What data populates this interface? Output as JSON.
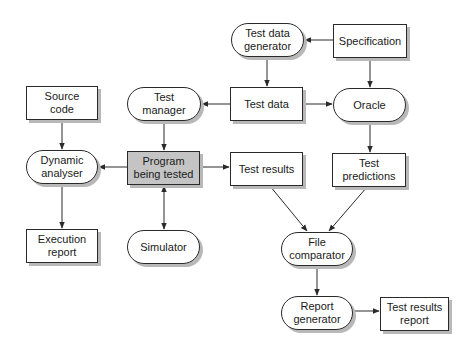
{
  "diagram": {
    "nodes": [
      {
        "id": "test-data-generator",
        "label": "Test data\ngenerator",
        "shape": "pill",
        "x": 231,
        "y": 23,
        "w": 73,
        "h": 34
      },
      {
        "id": "specification",
        "label": "Specification",
        "shape": "rect",
        "x": 333,
        "y": 24,
        "w": 74,
        "h": 34
      },
      {
        "id": "source-code",
        "label": "Source\ncode",
        "shape": "rect",
        "x": 26,
        "y": 86,
        "w": 72,
        "h": 34
      },
      {
        "id": "test-manager",
        "label": "Test\nmanager",
        "shape": "pill",
        "x": 127,
        "y": 87,
        "w": 74,
        "h": 34
      },
      {
        "id": "test-data",
        "label": "Test data",
        "shape": "rect",
        "x": 230,
        "y": 87,
        "w": 73,
        "h": 34
      },
      {
        "id": "oracle",
        "label": "Oracle",
        "shape": "pill",
        "x": 333,
        "y": 88,
        "w": 73,
        "h": 34
      },
      {
        "id": "dynamic-analyser",
        "label": "Dynamic\nanalyser",
        "shape": "pill",
        "x": 26,
        "y": 150,
        "w": 72,
        "h": 34
      },
      {
        "id": "program-being-tested",
        "label": "Program\nbeing tested",
        "shape": "rect",
        "highlight": true,
        "x": 127,
        "y": 151,
        "w": 73,
        "h": 34
      },
      {
        "id": "test-results",
        "label": "Test results",
        "shape": "rect",
        "x": 230,
        "y": 152,
        "w": 73,
        "h": 34
      },
      {
        "id": "test-predictions",
        "label": "Test\npredictions",
        "shape": "rect",
        "x": 332,
        "y": 153,
        "w": 74,
        "h": 34
      },
      {
        "id": "execution-report",
        "label": "Execution\nreport",
        "shape": "rect",
        "x": 26,
        "y": 229,
        "w": 72,
        "h": 34
      },
      {
        "id": "simulator",
        "label": "Simulator",
        "shape": "pill",
        "x": 127,
        "y": 230,
        "w": 73,
        "h": 34
      },
      {
        "id": "file-comparator",
        "label": "File\ncomparator",
        "shape": "pill",
        "x": 281,
        "y": 232,
        "w": 72,
        "h": 34
      },
      {
        "id": "report-generator",
        "label": "Report\ngenerator",
        "shape": "pill",
        "x": 281,
        "y": 296,
        "w": 72,
        "h": 34
      },
      {
        "id": "test-results-report",
        "label": "Test results\nreport",
        "shape": "rect",
        "x": 380,
        "y": 297,
        "w": 69,
        "h": 34
      }
    ],
    "edges": [
      {
        "from": "specification",
        "to": "test-data-generator",
        "points": [
          [
            333,
            40
          ],
          [
            305,
            40
          ]
        ]
      },
      {
        "from": "test-data-generator",
        "to": "test-data",
        "points": [
          [
            267,
            57
          ],
          [
            267,
            86
          ]
        ]
      },
      {
        "from": "specification",
        "to": "oracle",
        "points": [
          [
            370,
            58
          ],
          [
            370,
            87
          ]
        ]
      },
      {
        "from": "test-data",
        "to": "test-manager",
        "points": [
          [
            230,
            104
          ],
          [
            202,
            104
          ]
        ]
      },
      {
        "from": "test-data",
        "to": "oracle",
        "points": [
          [
            303,
            104
          ],
          [
            332,
            104
          ]
        ]
      },
      {
        "from": "source-code",
        "to": "dynamic-analyser",
        "points": [
          [
            62,
            120
          ],
          [
            62,
            149
          ]
        ]
      },
      {
        "from": "test-manager",
        "to": "program-being-tested",
        "points": [
          [
            164,
            121
          ],
          [
            164,
            150
          ]
        ]
      },
      {
        "from": "oracle",
        "to": "test-predictions",
        "points": [
          [
            370,
            122
          ],
          [
            370,
            152
          ]
        ]
      },
      {
        "from": "program-being-tested",
        "to": "dynamic-analyser",
        "points": [
          [
            127,
            167
          ],
          [
            99,
            167
          ]
        ]
      },
      {
        "from": "program-being-tested",
        "to": "test-results",
        "points": [
          [
            200,
            167
          ],
          [
            229,
            167
          ]
        ]
      },
      {
        "from": "dynamic-analyser",
        "to": "execution-report",
        "points": [
          [
            62,
            184
          ],
          [
            62,
            228
          ]
        ]
      },
      {
        "from": "program-being-tested",
        "to": "simulator",
        "bidirectional": true,
        "points": [
          [
            164,
            186
          ],
          [
            164,
            229
          ]
        ]
      },
      {
        "from": "test-results",
        "to": "file-comparator",
        "points": [
          [
            270,
            186
          ],
          [
            307,
            231
          ]
        ]
      },
      {
        "from": "test-predictions",
        "to": "file-comparator",
        "points": [
          [
            367,
            187
          ],
          [
            329,
            231
          ]
        ]
      },
      {
        "from": "file-comparator",
        "to": "report-generator",
        "points": [
          [
            317,
            266
          ],
          [
            317,
            295
          ]
        ]
      },
      {
        "from": "report-generator",
        "to": "test-results-report",
        "points": [
          [
            353,
            311
          ],
          [
            379,
            311
          ]
        ]
      }
    ],
    "colors": {
      "stroke": "#2a2a2a",
      "shadow": "#b8b8b8",
      "highlight": "#c4c4c4",
      "background": "#ffffff"
    }
  }
}
